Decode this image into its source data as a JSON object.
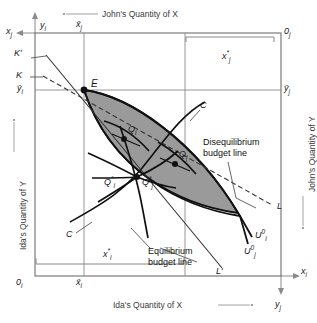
{
  "figure": {
    "type": "edgeworth-box",
    "shaded_region_color": "#9a9a9a",
    "line_color": "#111111",
    "thin_line_color": "#777777"
  },
  "axes": {
    "ida_origin": "0",
    "ida_origin_sub": "i",
    "john_origin": "0",
    "john_origin_sub": "j",
    "x_ida": "x",
    "x_ida_sub": "i",
    "y_ida": "y",
    "y_ida_sub": "i",
    "x_john": "x",
    "x_john_sub": "j",
    "y_john": "y",
    "y_john_sub": "j",
    "title_bottom": "Ida's Quantity of X",
    "title_left": "Ida's Quantity of Y",
    "title_top": "John's Quantity of X",
    "title_right": "John's Quantity of Y"
  },
  "endowment": {
    "point_label": "E",
    "xbar_john": "x̄",
    "xbar_john_sub": "j",
    "xbar_ida": "x̄",
    "xbar_ida_sub": "i",
    "ybar_ida": "ȳ",
    "ybar_ida_sub": "i",
    "ybar_john": "ȳ",
    "ybar_john_sub": "j"
  },
  "allocations": {
    "xstar_john": "x",
    "xstar_john_sub": "j",
    "xstar_john_sup": "*",
    "xstar_ida": "x",
    "xstar_ida_sub": "i",
    "xstar_ida_sup": "*"
  },
  "points": [
    {
      "name": "Q_i",
      "base": "Q",
      "sub": "i",
      "sup": "",
      "x": 128,
      "y": 133
    },
    {
      "name": "Q_j",
      "base": "Q",
      "sub": "j",
      "sup": "",
      "x": 178,
      "y": 158
    },
    {
      "name": "Q_i_star",
      "base": "Q",
      "sub": "i",
      "sup": "*",
      "x": 133,
      "y": 181
    },
    {
      "name": "Q_j_star",
      "base": "Q",
      "sub": "j",
      "sup": "*",
      "x": 133,
      "y": 181
    }
  ],
  "curve_labels": {
    "contract_curve_top": "C",
    "contract_curve_bottom": "C",
    "budget_line_K_prime": "K'",
    "budget_line_K": "K",
    "budget_line_L": "L",
    "budget_line_L_prime": "L'",
    "u_ida_zero": "U",
    "u_ida_zero_sub": "i",
    "u_ida_zero_sup": "0",
    "u_john_zero": "U",
    "u_john_zero_sub": "j",
    "u_john_zero_sup": "0"
  },
  "annotations": {
    "disequilibrium_line1": "Disequilibrium",
    "disequilibrium_line2": "budget line",
    "equilibrium_line1": "Equilibrium",
    "equilibrium_line2": "budget line"
  }
}
